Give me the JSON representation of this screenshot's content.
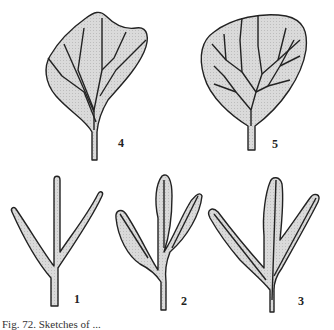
{
  "figure": {
    "labels": {
      "leaf4": "4",
      "leaf5": "5",
      "branch1": "1",
      "branch2": "2",
      "branch3": "3"
    },
    "caption": "Fig. 72. Sketches of ...",
    "colors": {
      "fill": "#d6d6d6",
      "stroke": "#222222",
      "background": "#ffffff"
    }
  }
}
